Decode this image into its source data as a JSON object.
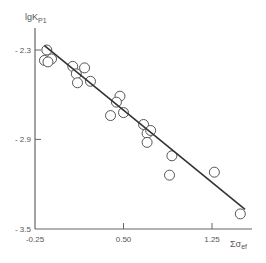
{
  "chart_data": {
    "type": "scatter",
    "title": "",
    "xlabel": "Σσ_ef",
    "ylabel": "lgK_P1",
    "xlim": [
      -0.25,
      1.6
    ],
    "ylim": [
      -3.5,
      -2.2
    ],
    "grid": false,
    "legend": null,
    "x_ticks": [
      -0.25,
      0.5,
      1.25
    ],
    "x_tick_labels": [
      "-0.25",
      "0.50",
      "1.25"
    ],
    "y_ticks": [
      -2.3,
      -2.9,
      -3.5
    ],
    "y_tick_labels": [
      "- 2.3",
      "- 2.9",
      "- 3.5"
    ],
    "series": [
      {
        "name": "observed",
        "marker": "open-circle",
        "points": [
          {
            "x": -0.15,
            "y": -2.3
          },
          {
            "x": -0.17,
            "y": -2.37
          },
          {
            "x": -0.11,
            "y": -2.36
          },
          {
            "x": -0.14,
            "y": -2.38
          },
          {
            "x": 0.07,
            "y": -2.41
          },
          {
            "x": 0.17,
            "y": -2.42
          },
          {
            "x": 0.1,
            "y": -2.46
          },
          {
            "x": 0.11,
            "y": -2.52
          },
          {
            "x": 0.22,
            "y": -2.51
          },
          {
            "x": 0.47,
            "y": -2.61
          },
          {
            "x": 0.44,
            "y": -2.65
          },
          {
            "x": 0.39,
            "y": -2.74
          },
          {
            "x": 0.5,
            "y": -2.72
          },
          {
            "x": 0.67,
            "y": -2.8
          },
          {
            "x": 0.7,
            "y": -2.86
          },
          {
            "x": 0.73,
            "y": -2.84
          },
          {
            "x": 0.7,
            "y": -2.92
          },
          {
            "x": 0.91,
            "y": -3.01
          },
          {
            "x": 0.89,
            "y": -3.14
          },
          {
            "x": 1.27,
            "y": -3.12
          },
          {
            "x": 1.49,
            "y": -3.4
          }
        ]
      },
      {
        "name": "regression-line",
        "type": "line",
        "points": [
          {
            "x": -0.17,
            "y": -2.27
          },
          {
            "x": 1.53,
            "y": -3.37
          }
        ]
      }
    ]
  },
  "labels": {
    "ylabel_main": "lgK",
    "ylabel_sub": "P1",
    "xlabel_main": "Σσ",
    "xlabel_sub": "ef"
  }
}
